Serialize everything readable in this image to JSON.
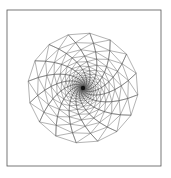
{
  "diagram": {
    "type": "graded triangular mesh",
    "bounding_box": {
      "x0": 7,
      "y0": 10,
      "x1": 161,
      "y1": 166
    },
    "refinement_center": {
      "x": 83,
      "y": 88
    },
    "stroke_color": "#555555",
    "node_color": "#333333",
    "rings": 22,
    "inner_radius": 1.2,
    "growth": 1.2,
    "twist_per_ring": 0.09
  },
  "caption": {
    "text": ""
  }
}
